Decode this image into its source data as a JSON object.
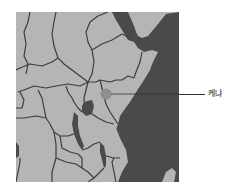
{
  "map": {
    "region": "East Africa",
    "colors": {
      "land": "#b5b5b5",
      "water": "#4a4a4a",
      "border": "#3c3c3c",
      "marker": "#8e8e8e",
      "background": "#ffffff"
    },
    "marker": {
      "label": "케냐",
      "country": "Kenya"
    }
  }
}
